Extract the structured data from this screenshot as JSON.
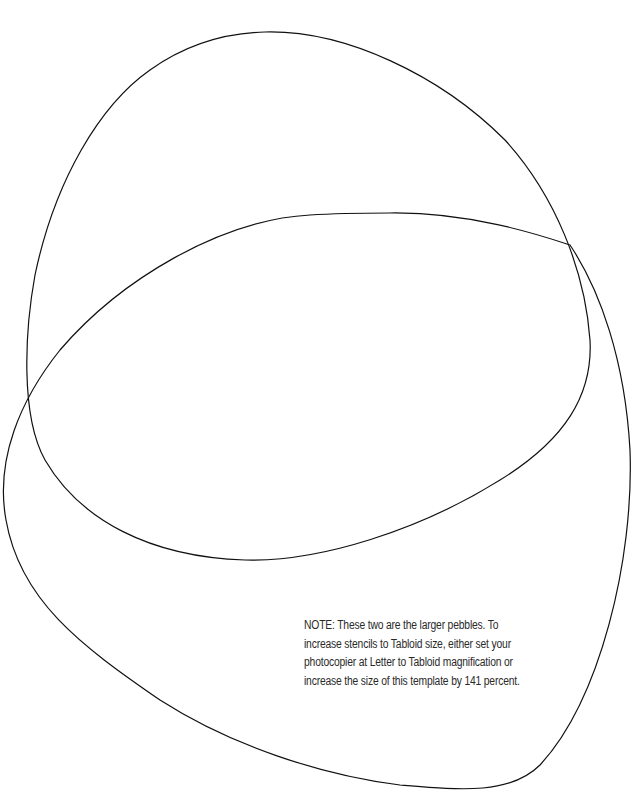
{
  "page": {
    "background": "#ffffff",
    "stroke_color": "#111111"
  },
  "shapes": [
    {
      "name": "pebble-upper",
      "description": "Upper smaller pebble outline"
    },
    {
      "name": "pebble-lower",
      "description": "Lower larger pebble outline"
    }
  ],
  "note": {
    "lines": [
      "NOTE: These two are the larger pebbles. To",
      "increase stencils to Tabloid size, either set your",
      "photocopier at Letter to Tabloid magnification or",
      "increase the size of this template by 141 percent."
    ]
  }
}
